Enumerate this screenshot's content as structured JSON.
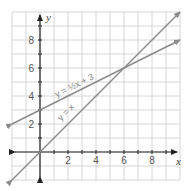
{
  "chart_data": {
    "type": "line",
    "title": "",
    "xlabel": "x",
    "ylabel": "y",
    "xlim": [
      -2,
      10
    ],
    "ylim": [
      -2,
      10
    ],
    "grid": true,
    "x_ticks": [
      "2",
      "4",
      "6",
      "8"
    ],
    "y_ticks": [
      "2",
      "4",
      "6",
      "8"
    ],
    "series": [
      {
        "name": "y = x",
        "label": "y = x",
        "slope": 1,
        "intercept": 0,
        "x": [
          -2,
          10
        ],
        "y": [
          -2,
          10
        ]
      },
      {
        "name": "y = ½x + 3",
        "label": "y = ½x + 3",
        "slope": 0.5,
        "intercept": 3,
        "x": [
          -2,
          10
        ],
        "y": [
          2,
          8
        ]
      }
    ],
    "annotations": [
      "intersection at (6, 6)"
    ],
    "colors": {
      "lines": "#8a8a8a",
      "axes": "#222222",
      "grid": "#cccccc"
    }
  }
}
